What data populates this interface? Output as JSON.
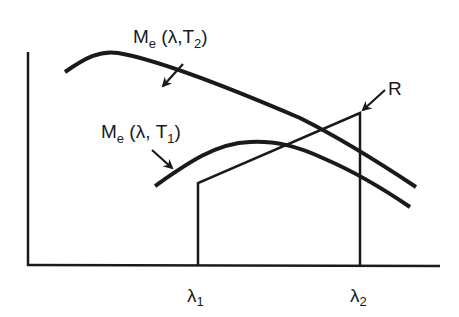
{
  "diagram": {
    "title": "",
    "colors": {
      "ink": "#1a1a1a",
      "background": "#ffffff"
    },
    "curves": [
      {
        "id": "Me_T2",
        "label_main": "M",
        "label_sub": "e",
        "label_args_open": " (λ,T",
        "label_args_sub": "2",
        "label_args_close": ")"
      },
      {
        "id": "Me_T1",
        "label_main": "M",
        "label_sub": "e",
        "label_args_open": " (λ, T",
        "label_args_sub": "1",
        "label_args_close": ")"
      },
      {
        "id": "R",
        "label": "R"
      }
    ],
    "x_ticks": [
      {
        "symbol": "λ",
        "sub": "1"
      },
      {
        "symbol": "λ",
        "sub": "2"
      }
    ]
  }
}
